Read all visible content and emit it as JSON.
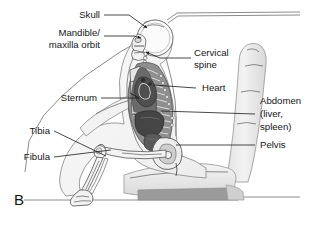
{
  "figure": {
    "panel_letter": "B",
    "background_color": "#ffffff",
    "description_kind": "anatomical-sagittal-diagram"
  },
  "palette": {
    "label_text": "#151515",
    "leader_line": "#1a1a1a",
    "bone_fill": "#f2f2f2",
    "bone_stroke": "#5d5d5d",
    "organ_dark": "#4d4d4d",
    "organ_mid": "#6f6f6f",
    "organ_light": "#9a9a9a",
    "ribcage_fill": "#8a8a8a",
    "seat_fill": "#ececec",
    "seat_shade": "#dcdcdc",
    "seat_base_dark": "#9b9b9b",
    "body_outline": "#777777"
  },
  "labels": [
    {
      "id": "skull",
      "text": "Skull",
      "text_x": 100,
      "text_y": 18,
      "anchor": "end",
      "lines": [
        "Skull"
      ],
      "leader": "M104,15 L129,15 L147,28",
      "has_arrow": true
    },
    {
      "id": "mandible-maxilla-orbit",
      "text": "Mandible/ maxilla orbit",
      "text_x": 100,
      "text_y": 39,
      "anchor": "end",
      "lines": [
        "Mandible/",
        "maxilla orbit"
      ],
      "leader": "M104,36 L134,36 L141,38",
      "has_arrow": true
    },
    {
      "id": "cervical-spine",
      "text": "Cervical spine",
      "text_x": 194,
      "text_y": 55,
      "anchor": "start",
      "lines": [
        "Cervical",
        "spine"
      ],
      "leader": "M191,58 L160,58 L146,52",
      "has_arrow": true
    },
    {
      "id": "heart",
      "text": "Heart",
      "text_x": 200,
      "text_y": 91,
      "anchor": "start",
      "lines": [
        "Heart"
      ],
      "leader": "M196,88 L153,85",
      "has_arrow": false
    },
    {
      "id": "sternum",
      "text": "Sternum",
      "text_x": 97,
      "text_y": 101,
      "anchor": "end",
      "lines": [
        "Sternum"
      ],
      "leader": "M101,98 L139,98 L130,93",
      "has_arrow": false
    },
    {
      "id": "abdomen-liver-spleen",
      "text": "Abdomen (liver, spleen)",
      "text_x": 258,
      "text_y": 112,
      "anchor": "start",
      "lines": [
        "Abdomen",
        "(liver,",
        "spleen)"
      ],
      "leader": "M255,114 L161,111",
      "has_arrow": false
    },
    {
      "id": "pelvis",
      "text": "Pelvis",
      "text_x": 258,
      "text_y": 148,
      "anchor": "start",
      "lines": [
        "Pelvis"
      ],
      "leader": "M255,145 L176,145",
      "has_arrow": false
    },
    {
      "id": "tibia",
      "text": "Tibia",
      "text_x": 50,
      "text_y": 134,
      "anchor": "end",
      "lines": [
        "Tibia"
      ],
      "leader": "M54,131 L106,156",
      "has_arrow": false
    },
    {
      "id": "fibula",
      "text": "Fibula",
      "text_x": 50,
      "text_y": 160,
      "anchor": "end",
      "lines": [
        "Fibula"
      ],
      "leader": "M54,157 L111,150",
      "has_arrow": false
    }
  ],
  "anatomy_parts": [
    {
      "id": "skull-cranium",
      "name": "cranium"
    },
    {
      "id": "facial-bones",
      "name": "mandible-maxilla-orbit"
    },
    {
      "id": "cervical-vertebrae",
      "name": "cervical-spine"
    },
    {
      "id": "thoracic-spine",
      "name": "thoracic-spine"
    },
    {
      "id": "ribcage",
      "name": "ribcage"
    },
    {
      "id": "sternum-bone",
      "name": "sternum"
    },
    {
      "id": "heart-organ",
      "name": "heart"
    },
    {
      "id": "lung-field",
      "name": "lung"
    },
    {
      "id": "liver-organ",
      "name": "liver"
    },
    {
      "id": "spleen-organ",
      "name": "spleen"
    },
    {
      "id": "pelvis-bone",
      "name": "pelvis"
    },
    {
      "id": "femur-bone",
      "name": "femur"
    },
    {
      "id": "tibia-bone",
      "name": "tibia"
    },
    {
      "id": "fibula-bone",
      "name": "fibula"
    },
    {
      "id": "foot-bones",
      "name": "foot"
    },
    {
      "id": "humerus-arm",
      "name": "arm"
    }
  ],
  "vehicle_parts": [
    {
      "id": "roof-line",
      "name": "vehicle-roof"
    },
    {
      "id": "windshield-line",
      "name": "windshield"
    },
    {
      "id": "seat-back",
      "name": "seat-back"
    },
    {
      "id": "seat-cushion",
      "name": "seat-cushion"
    },
    {
      "id": "seat-base",
      "name": "seat-base"
    },
    {
      "id": "floor-line",
      "name": "floor"
    }
  ]
}
